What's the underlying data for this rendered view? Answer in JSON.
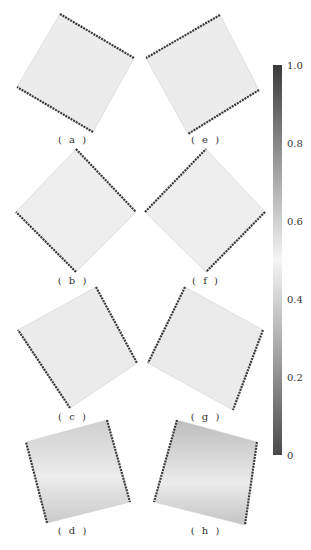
{
  "figure": {
    "colorbar": {
      "min": 0,
      "max": 1.0,
      "ticks": [
        {
          "label": "1.0",
          "value": 1.0
        },
        {
          "label": "0.8",
          "value": 0.8
        },
        {
          "label": "0.6",
          "value": 0.6
        },
        {
          "label": "0.4",
          "value": 0.4
        },
        {
          "label": "0.2",
          "value": 0.2
        },
        {
          "label": "0",
          "value": 0
        }
      ],
      "colors": {
        "high": "#3a3a3a",
        "mid": "#f4f4f4",
        "low": "#4a4a4a"
      }
    },
    "panels": [
      {
        "id": "a",
        "label": "( a )",
        "points": "60,14 134,58 93,132 17,87",
        "label_x": 73,
        "label_y": 136,
        "fill": "#ececec",
        "edges": [
          [
            0,
            1
          ],
          [
            2,
            3
          ]
        ]
      },
      {
        "id": "b",
        "label": "( b )",
        "points": "76,149 136,212 76,272 16,212",
        "label_x": 73,
        "label_y": 277,
        "fill": "#eeeeee",
        "edges": [
          [
            0,
            1
          ],
          [
            2,
            3
          ]
        ]
      },
      {
        "id": "c",
        "label": "( c )",
        "points": "96,287 137,363 70,408 18,330",
        "label_x": 73,
        "label_y": 413,
        "fill": "#ebebeb",
        "edges": [
          [
            0,
            1
          ],
          [
            2,
            3
          ]
        ]
      },
      {
        "id": "d",
        "label": "( d )",
        "points": "26,442 107,420 130,502 47,523",
        "label_x": 73,
        "label_y": 527,
        "fill": "#e2e2e2",
        "edges": [
          [
            1,
            2
          ],
          [
            3,
            0
          ]
        ]
      },
      {
        "id": "e",
        "label": "( e )",
        "points": "220,15 259,90 188,134 146,58",
        "label_x": 206,
        "label_y": 136,
        "fill": "#ececec",
        "edges": [
          [
            0,
            3
          ],
          [
            1,
            2
          ]
        ]
      },
      {
        "id": "f",
        "label": "( f )",
        "points": "206,149 265,212 206,272 145,212",
        "label_x": 206,
        "label_y": 277,
        "fill": "#eeeeee",
        "edges": [
          [
            3,
            0
          ],
          [
            1,
            2
          ]
        ]
      },
      {
        "id": "g",
        "label": "( g )",
        "points": "185,287 263,330 233,410 148,363",
        "label_x": 206,
        "label_y": 413,
        "fill": "#ebebeb",
        "edges": [
          [
            0,
            3
          ],
          [
            1,
            2
          ]
        ]
      },
      {
        "id": "h",
        "label": "( h )",
        "points": "177,420 257,442 245,525 154,502",
        "label_x": 206,
        "label_y": 527,
        "fill": "#dedede",
        "edges": [
          [
            0,
            3
          ],
          [
            1,
            2
          ]
        ]
      }
    ]
  }
}
